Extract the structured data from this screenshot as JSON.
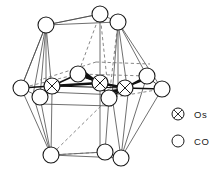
{
  "figure": {
    "title": "",
    "caption": "",
    "type": "molecular-structure-diagram"
  },
  "legend": {
    "position": "bottom-right",
    "items": [
      {
        "symbol": "crossed-circle",
        "label": "Os"
      },
      {
        "symbol": "open-circle",
        "label": "CO"
      }
    ]
  },
  "colors": {
    "stroke": "#1a1a1a",
    "fill": "#ffffff",
    "background": "#ffffff",
    "bond_solid": "#111111",
    "bond_thin": "#555555",
    "bond_dashed": "#666666"
  },
  "structure": {
    "metal_atoms": [
      {
        "id": "os1",
        "label": "Os",
        "x": 52,
        "y": 86,
        "r": 8
      },
      {
        "id": "os2",
        "label": "Os",
        "x": 100,
        "y": 83,
        "r": 8
      },
      {
        "id": "os3",
        "label": "Os",
        "x": 125,
        "y": 88,
        "r": 8
      }
    ],
    "ligand_atoms": [
      {
        "id": "co1",
        "label": "CO",
        "x": 100,
        "y": 14,
        "r": 8
      },
      {
        "id": "co2",
        "label": "CO",
        "x": 46,
        "y": 25,
        "r": 8
      },
      {
        "id": "co3",
        "label": "CO",
        "x": 118,
        "y": 22,
        "r": 8
      },
      {
        "id": "co4",
        "label": "CO",
        "x": 21,
        "y": 88,
        "r": 8
      },
      {
        "id": "co5",
        "label": "CO",
        "x": 40,
        "y": 97,
        "r": 8
      },
      {
        "id": "co6",
        "label": "CO",
        "x": 78,
        "y": 74,
        "r": 8
      },
      {
        "id": "co7",
        "label": "CO",
        "x": 109,
        "y": 98,
        "r": 8
      },
      {
        "id": "co8",
        "label": "CO",
        "x": 147,
        "y": 76,
        "r": 8
      },
      {
        "id": "co9",
        "label": "CO",
        "x": 162,
        "y": 89,
        "r": 8
      },
      {
        "id": "co10",
        "label": "CO",
        "x": 51,
        "y": 155,
        "r": 8
      },
      {
        "id": "co11",
        "label": "CO",
        "x": 105,
        "y": 152,
        "r": 8
      },
      {
        "id": "co12",
        "label": "CO",
        "x": 121,
        "y": 158,
        "r": 8
      }
    ],
    "counts": {
      "metal": 3,
      "ligand": 12
    }
  }
}
